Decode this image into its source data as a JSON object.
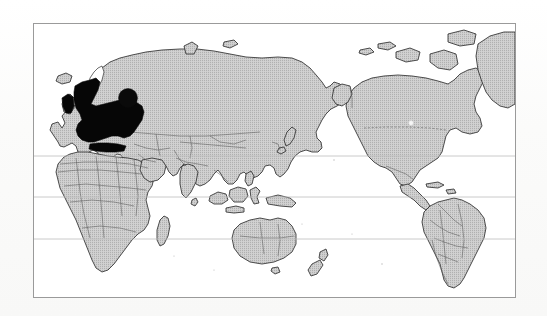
{
  "page": {
    "background_color": "#fcfcfc",
    "width": 547,
    "height": 316
  },
  "figure": {
    "name": "world-map-figure",
    "type": "thematic-world-map",
    "projection": "equirectangular-eurocentric",
    "frame": {
      "x": 33,
      "y": 23,
      "width": 483,
      "height": 275,
      "border_color": "#9a9a9a",
      "fill_color": "#ffffff"
    },
    "ocean_color": "#ffffff",
    "land_color": "#c9c9c9",
    "land_outline_color": "#2a2a2a",
    "country_border_color": "#555555",
    "highlight_color": "#000000",
    "gridline_color": "#b9b9b9",
    "gridlines": [
      {
        "name": "tropic-of-cancer",
        "y": 155
      },
      {
        "name": "equator",
        "y": 196
      },
      {
        "name": "tropic-of-capricorn",
        "y": 238
      }
    ],
    "highlights": [
      {
        "name": "europe-highlight",
        "label": "Europe",
        "style": "solid-black-fill"
      },
      {
        "name": "study-site-marker",
        "label": "Study site",
        "style": "filled-circle",
        "cx": 127,
        "cy": 97,
        "r": 9
      },
      {
        "name": "secondary-site-marker",
        "label": "Secondary site",
        "style": "small-light-dot",
        "cx": 410,
        "cy": 122,
        "r": 2.2
      }
    ],
    "landmasses": [
      "Eurasia",
      "Africa",
      "North America",
      "South America",
      "Australia",
      "Greenland",
      "Madagascar",
      "New Zealand",
      "Indonesia",
      "Japan",
      "British Isles",
      "Iceland",
      "Caribbean"
    ],
    "alt_text": "Black-and-white scanned world map with all continents shaded light grey, Europe filled solid black, and a filled black circle marker placed over western Russia."
  }
}
